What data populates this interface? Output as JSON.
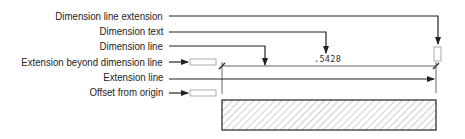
{
  "labels": [
    {
      "text": "Dimension line extension",
      "y": 16
    },
    {
      "text": "Dimension text",
      "y": 31
    },
    {
      "text": "Dimension line",
      "y": 46
    },
    {
      "text": "Extension beyond dimension line",
      "y": 62
    },
    {
      "text": "Extension line",
      "y": 77
    },
    {
      "text": "Offset from origin",
      "y": 92
    }
  ],
  "dimension_value": ".5428",
  "colors": {
    "line": "#222222",
    "light_line": "#888888",
    "hatch": "#777777",
    "background": "#ffffff"
  }
}
